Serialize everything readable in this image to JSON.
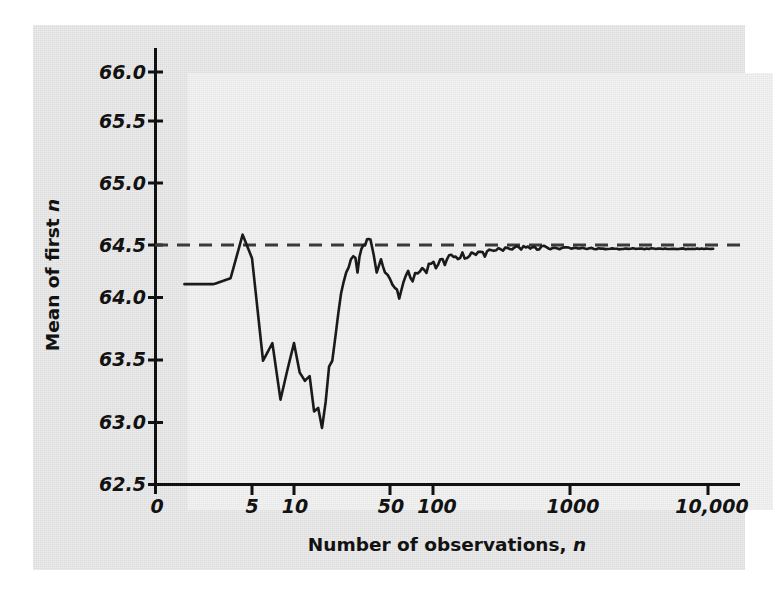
{
  "figure": {
    "background_color": "#e2e2e2",
    "plot_background_color": "#ebebeb",
    "line_color": "#1a1a1a",
    "reference_line_color": "#3a3a3a"
  },
  "axis_titles": {
    "x_prefix": "Number of observations, ",
    "x_variable": "n",
    "y_prefix": "Mean of first ",
    "y_variable": "n"
  },
  "y_ticks": [
    "62.5",
    "63.0",
    "63.5",
    "64.0",
    "64.5",
    "65.0",
    "65.5",
    "66.0"
  ],
  "x_ticks": [
    "0",
    "5",
    "10",
    "50",
    "100",
    "1000",
    "10,000"
  ],
  "chart_data": {
    "type": "line",
    "title": "",
    "xlabel": "Number of observations, n",
    "ylabel": "Mean of first n",
    "xscale": "log-with-zero-origin",
    "ylim": [
      62.5,
      66.0
    ],
    "ytick_values": [
      62.5,
      63.0,
      63.5,
      64.0,
      64.5,
      65.0,
      65.5,
      66.0
    ],
    "xtick_values": [
      0,
      5,
      10,
      50,
      100,
      1000,
      10000
    ],
    "grid": false,
    "legend": null,
    "annotations": [
      {
        "type": "reference-line",
        "style": "dashed",
        "orientation": "horizontal",
        "y": 64.5,
        "label": "population mean 64.5"
      }
    ],
    "series": [
      {
        "name": "Running mean of first n observations",
        "x": [
          1,
          2,
          3,
          4,
          5,
          6,
          7,
          8,
          9,
          10,
          11,
          12,
          13,
          14,
          15,
          16,
          17,
          18,
          19,
          20,
          21,
          22,
          23,
          24,
          25,
          26,
          27,
          28,
          29,
          30,
          32,
          34,
          36,
          38,
          40,
          43,
          46,
          50,
          54,
          58,
          62,
          67,
          72,
          78,
          84,
          90,
          97,
          105,
          113,
          122,
          131,
          141,
          152,
          164,
          177,
          191,
          206,
          222,
          239,
          258,
          278,
          300,
          324,
          350,
          378,
          408,
          440,
          475,
          512,
          553,
          597,
          644,
          695,
          750,
          810,
          874,
          943,
          1018,
          1099,
          1186,
          1280,
          1382,
          1492,
          1610,
          1738,
          1876,
          2025,
          2186,
          2360,
          2548,
          2750,
          2969,
          3205,
          3460,
          3735,
          4032,
          4352,
          4699,
          5072,
          5475,
          5910,
          6380,
          6887,
          7434,
          8025,
          8663,
          9352,
          10000,
          10900
        ],
        "y": [
          64.2,
          64.2,
          64.25,
          64.62,
          64.42,
          63.55,
          63.7,
          63.22,
          63.48,
          63.7,
          63.45,
          63.38,
          63.42,
          63.12,
          63.15,
          62.98,
          63.2,
          63.5,
          63.55,
          63.75,
          63.95,
          64.12,
          64.22,
          64.3,
          64.3,
          64.42,
          64.4,
          64.45,
          64.35,
          64.42,
          64.5,
          64.58,
          64.55,
          64.45,
          64.32,
          64.38,
          64.3,
          64.22,
          64.18,
          64.1,
          64.22,
          64.28,
          64.24,
          64.3,
          64.36,
          64.32,
          64.38,
          64.35,
          64.4,
          64.38,
          64.44,
          64.42,
          64.4,
          64.45,
          64.42,
          64.46,
          64.44,
          64.48,
          64.45,
          64.5,
          64.47,
          64.5,
          64.48,
          64.52,
          64.49,
          64.51,
          64.5,
          64.52,
          64.5,
          64.51,
          64.5,
          64.52,
          64.5,
          64.51,
          64.5,
          64.5,
          64.51,
          64.5,
          64.5,
          64.5,
          64.5,
          64.5,
          64.5,
          64.5,
          64.5,
          64.5,
          64.5,
          64.5,
          64.5,
          64.5,
          64.5,
          64.5,
          64.5,
          64.5,
          64.5,
          64.5,
          64.5,
          64.5,
          64.5,
          64.5,
          64.5,
          64.5,
          64.5,
          64.5,
          64.5,
          64.5,
          64.5,
          64.5,
          64.5
        ]
      }
    ]
  }
}
